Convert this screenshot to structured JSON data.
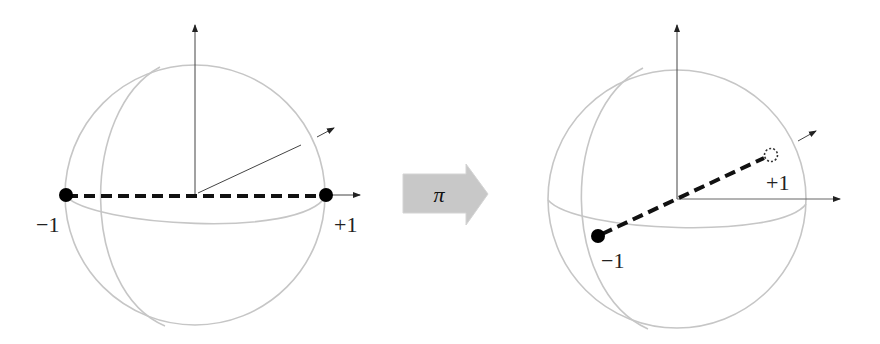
{
  "figure": {
    "left_panel": {
      "name": "before-rotation",
      "labels": {
        "minus": "−1",
        "plus": "+1"
      }
    },
    "operator": {
      "name": "pi-rotation-arrow",
      "label": "π",
      "fill": "#c8c8c8"
    },
    "right_panel": {
      "name": "after-rotation",
      "labels": {
        "minus": "−1",
        "plus": "+1"
      }
    },
    "colors": {
      "sphere_outline": "#c4c4c4",
      "axes": "#333333",
      "dashed_line": "#111111",
      "points": "#000000"
    }
  }
}
